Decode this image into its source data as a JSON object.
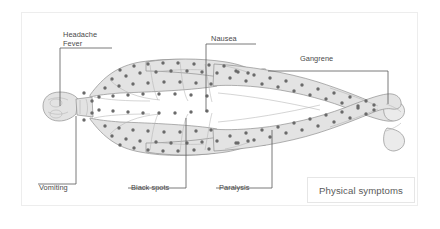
{
  "figure": {
    "title": "Physical symptoms",
    "orientation": "horizontal-supine-head-left",
    "colors": {
      "body_fill": "#e3e3e3",
      "body_stroke": "#8f8f8f",
      "spot": "#6a6a6a",
      "leader_line": "#585858",
      "label_text": "#4a4a4a",
      "frame_border": "#ededed",
      "title_border": "#e6e6e6",
      "background": "#ffffff"
    }
  },
  "callouts": [
    {
      "id": "headache-fever",
      "lines": [
        "Headache",
        "Fever"
      ],
      "text": "Headache Fever",
      "target": "head"
    },
    {
      "id": "nausea",
      "lines": [
        "Nausea"
      ],
      "text": "Nausea",
      "target": "abdomen"
    },
    {
      "id": "gangrene",
      "lines": [
        "Gangrene"
      ],
      "text": "Gangrene",
      "target": "foot"
    },
    {
      "id": "vomiting",
      "lines": [
        "Vomiting"
      ],
      "text": "Vomiting",
      "target": "neck"
    },
    {
      "id": "black-spots",
      "lines": [
        "Black spots"
      ],
      "text": "Black spots",
      "target": "lower-torso"
    },
    {
      "id": "paralysis",
      "lines": [
        "Paralysis"
      ],
      "text": "Paralysis",
      "target": "leg"
    }
  ]
}
